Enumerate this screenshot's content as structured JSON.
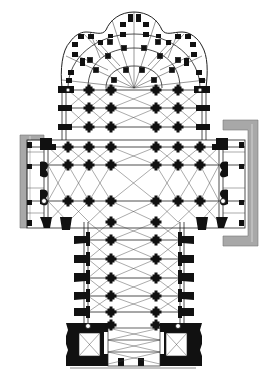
{
  "diagram": {
    "type": "architectural-floor-plan",
    "orientation": "apse at top, west front at bottom",
    "colors": {
      "background": "#ffffff",
      "ink": "#111111",
      "vault_lines": "#333333",
      "hatch_wall": "#9a9a9a"
    },
    "parts": [
      {
        "id": "chevet",
        "label": "Chevet with radiating chapels"
      },
      {
        "id": "choir",
        "label": "Choir with double ambulatory"
      },
      {
        "id": "transept",
        "label": "Transept"
      },
      {
        "id": "nave",
        "label": "Nave with aisles"
      },
      {
        "id": "west-front",
        "label": "West front with twin towers"
      }
    ]
  }
}
